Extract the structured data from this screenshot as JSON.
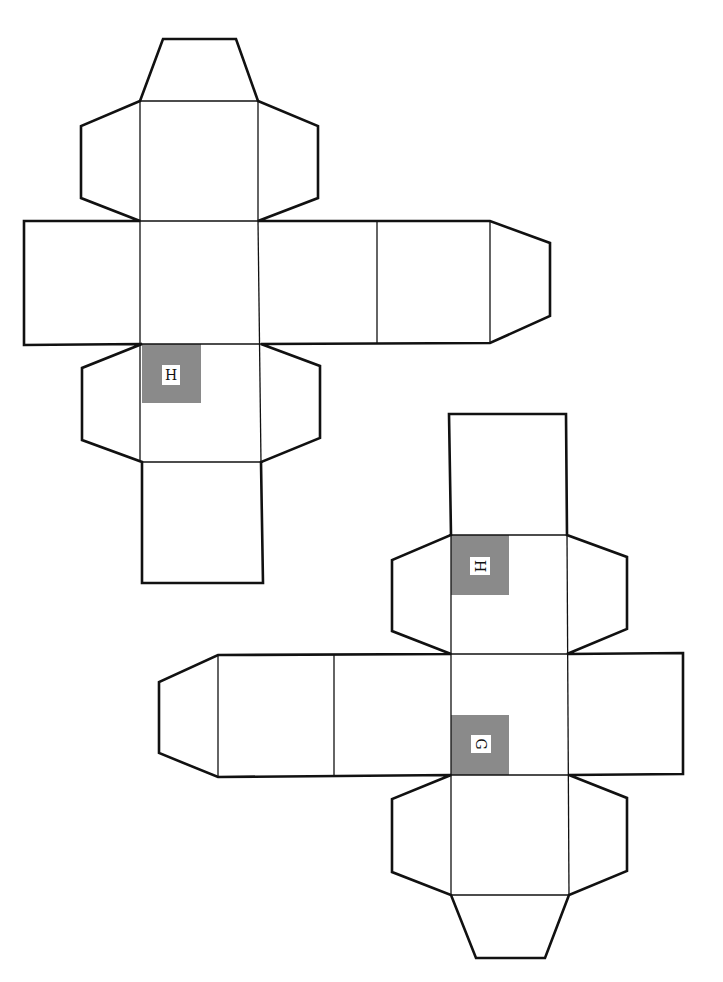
{
  "diagram": {
    "title": "",
    "colors": {
      "line": "#111111",
      "shade": "#8a8a8a",
      "background": "#ffffff"
    },
    "nets": [
      {
        "id": "net-1",
        "labels": [
          {
            "text": "H",
            "rotation": 0
          }
        ]
      },
      {
        "id": "net-2",
        "labels": [
          {
            "text": "H",
            "rotation": 90
          },
          {
            "text": "G",
            "rotation": 90
          }
        ]
      }
    ]
  }
}
